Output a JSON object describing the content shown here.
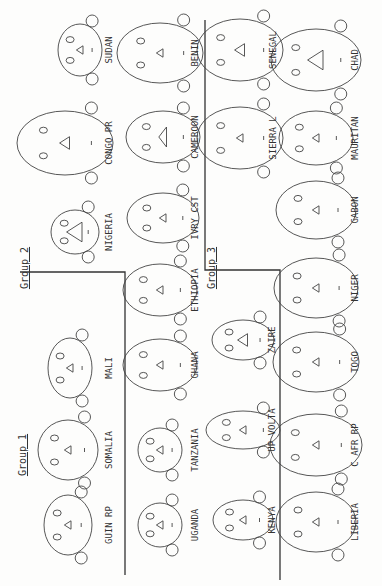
{
  "groups": [
    {
      "label": "Group 1",
      "x": 26,
      "y": 455
    },
    {
      "label": "Group 2",
      "x": 28,
      "y": 268
    },
    {
      "label": "Group 3",
      "x": 215,
      "y": 268
    }
  ],
  "faces": [
    {
      "name": "SUDAN",
      "cx": 80,
      "cy": 50,
      "rx": 26,
      "ry": 22,
      "tri": "small",
      "lx": 112,
      "ly": 50
    },
    {
      "name": "CONGO PR",
      "cx": 65,
      "cy": 143,
      "rx": 32,
      "ry": 48,
      "tri": "med",
      "lx": 112,
      "ly": 143
    },
    {
      "name": "NIGERIA",
      "cx": 75,
      "cy": 232,
      "rx": 22,
      "ry": 24,
      "tri": "big",
      "lx": 112,
      "ly": 232
    },
    {
      "name": "BENIN",
      "cx": 160,
      "cy": 53,
      "rx": 30,
      "ry": 43,
      "tri": "small",
      "lx": 198,
      "ly": 53
    },
    {
      "name": "CAMEROON",
      "cx": 163,
      "cy": 137,
      "rx": 26,
      "ry": 37,
      "tri": "flat",
      "lx": 198,
      "ly": 137
    },
    {
      "name": "IVRY CST",
      "cx": 163,
      "cy": 218,
      "rx": 25,
      "ry": 36,
      "tri": "small",
      "lx": 198,
      "ly": 218
    },
    {
      "name": "ETHIOPIA",
      "cx": 160,
      "cy": 290,
      "rx": 26,
      "ry": 37,
      "tri": "small",
      "lx": 198,
      "ly": 290
    },
    {
      "name": "GHANA",
      "cx": 160,
      "cy": 365,
      "rx": 26,
      "ry": 37,
      "tri": "small",
      "lx": 198,
      "ly": 365
    },
    {
      "name": "MALI",
      "cx": 70,
      "cy": 368,
      "rx": 30,
      "ry": 22,
      "tri": "small",
      "lx": 112,
      "ly": 368
    },
    {
      "name": "SOMALIA",
      "cx": 68,
      "cy": 450,
      "rx": 30,
      "ry": 30,
      "tri": "small",
      "lx": 112,
      "ly": 450
    },
    {
      "name": "GUIN RP",
      "cx": 68,
      "cy": 525,
      "rx": 30,
      "ry": 24,
      "tri": "small",
      "lx": 112,
      "ly": 525
    },
    {
      "name": "TANZANIA",
      "cx": 160,
      "cy": 450,
      "rx": 22,
      "ry": 22,
      "tri": "small",
      "lx": 198,
      "ly": 450
    },
    {
      "name": "UGANDA",
      "cx": 160,
      "cy": 525,
      "rx": 22,
      "ry": 22,
      "tri": "small",
      "lx": 198,
      "ly": 525
    },
    {
      "name": "SENEGAL",
      "cx": 240,
      "cy": 50,
      "rx": 31,
      "ry": 43,
      "tri": "med",
      "lx": 276,
      "ly": 50
    },
    {
      "name": "SIERRA L",
      "cx": 240,
      "cy": 138,
      "rx": 31,
      "ry": 43,
      "tri": "small",
      "lx": 276,
      "ly": 138
    },
    {
      "name": "CHAD",
      "cx": 316,
      "cy": 60,
      "rx": 31,
      "ry": 45,
      "tri": "big",
      "lx": 358,
      "ly": 60
    },
    {
      "name": "MAURITAN",
      "cx": 316,
      "cy": 138,
      "rx": 27,
      "ry": 37,
      "tri": "small",
      "lx": 358,
      "ly": 138
    },
    {
      "name": "GABON",
      "cx": 316,
      "cy": 210,
      "rx": 29,
      "ry": 40,
      "tri": "small",
      "lx": 358,
      "ly": 210
    },
    {
      "name": "NIGER",
      "cx": 316,
      "cy": 288,
      "rx": 30,
      "ry": 42,
      "tri": "small",
      "lx": 358,
      "ly": 288
    },
    {
      "name": "TOGO",
      "cx": 316,
      "cy": 362,
      "rx": 30,
      "ry": 43,
      "tri": "small",
      "lx": 358,
      "ly": 362
    },
    {
      "name": "ZAIRE",
      "cx": 243,
      "cy": 340,
      "rx": 20,
      "ry": 31,
      "tri": "med",
      "lx": 275,
      "ly": 340
    },
    {
      "name": "UP VOLTA",
      "cx": 243,
      "cy": 430,
      "rx": 19,
      "ry": 37,
      "tri": "small",
      "lx": 275,
      "ly": 430
    },
    {
      "name": "KENYA",
      "cx": 243,
      "cy": 520,
      "rx": 20,
      "ry": 30,
      "tri": "small",
      "lx": 275,
      "ly": 520
    },
    {
      "name": "C AFR RP",
      "cx": 316,
      "cy": 445,
      "rx": 31,
      "ry": 46,
      "tri": "small",
      "lx": 358,
      "ly": 445
    },
    {
      "name": "LIBERIA",
      "cx": 316,
      "cy": 522,
      "rx": 30,
      "ry": 40,
      "tri": "small",
      "lx": 358,
      "ly": 522
    }
  ]
}
